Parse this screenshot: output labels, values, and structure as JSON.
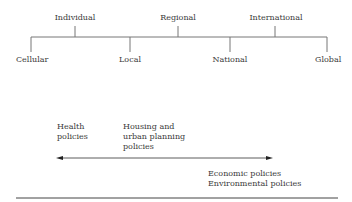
{
  "scale": {
    "top_levels": [
      {
        "label": "Individual",
        "x": 75
      },
      {
        "label": "Regional",
        "x": 178
      },
      {
        "label": "International",
        "x": 275
      }
    ],
    "bottom_levels": [
      {
        "label": "Cellular",
        "x": 31
      },
      {
        "label": "Local",
        "x": 130
      },
      {
        "label": "National",
        "x": 230
      },
      {
        "label": "Global",
        "x": 327
      }
    ]
  },
  "policies": {
    "health": "Health\npolicies",
    "housing": "Housing and\nurban planning\npolicies",
    "economic": "Economic policies\nEnvironmental policies"
  },
  "colors": {
    "line": "#6a6a6a",
    "text": "#3a3a3a"
  }
}
